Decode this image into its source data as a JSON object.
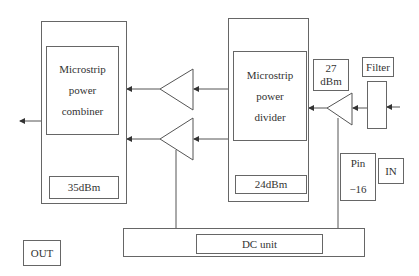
{
  "diagram": {
    "type": "block-diagram",
    "combiner": {
      "label_lines": [
        "Microstrip",
        "power",
        "combiner"
      ],
      "power": "35dBm"
    },
    "divider": {
      "label_lines": [
        "Microstrip",
        "power",
        "divider"
      ],
      "power": "24dBm"
    },
    "driver_amp": {
      "power_lines": [
        "27",
        "dBm"
      ]
    },
    "filter": {
      "label": "Filter"
    },
    "input": {
      "pin_lines": [
        "Pin",
        "−16"
      ],
      "label": "IN"
    },
    "dc_unit": {
      "label": "DC unit"
    },
    "output": {
      "label": "OUT"
    }
  }
}
